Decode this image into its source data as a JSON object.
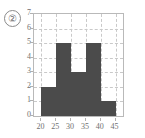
{
  "item_label": "②",
  "colors": {
    "bar": "#4b4b4b",
    "grid": "#c9c9c9",
    "frame": "#b9b9b9",
    "text": "#6f6f6f",
    "background": "#ffffff"
  },
  "chart_data": {
    "type": "bar",
    "title": "",
    "subtitle": "",
    "xlabel": "",
    "ylabel": "",
    "categories": [
      "20-25",
      "25-30",
      "30-35",
      "35-40",
      "40-45"
    ],
    "bin_edges": [
      20,
      25,
      30,
      35,
      40,
      45
    ],
    "values": [
      2,
      5,
      3,
      5,
      1
    ],
    "x": [
      22.5,
      27.5,
      32.5,
      37.5,
      42.5
    ],
    "xlim": [
      17.5,
      47.5
    ],
    "ylim": [
      0,
      7
    ],
    "xticks": [
      20,
      25,
      30,
      35,
      40,
      45
    ],
    "yticks": [
      0,
      1,
      2,
      3,
      4,
      5,
      6,
      7
    ],
    "xtick_labels": [
      "20",
      "25",
      "30",
      "35",
      "40",
      "45"
    ],
    "ytick_labels": [
      "0",
      "1",
      "2",
      "3",
      "4",
      "5",
      "6",
      "7"
    ],
    "grid": true,
    "grid_style": "dashed",
    "legend": null,
    "legend_position": "none",
    "annotations": []
  }
}
